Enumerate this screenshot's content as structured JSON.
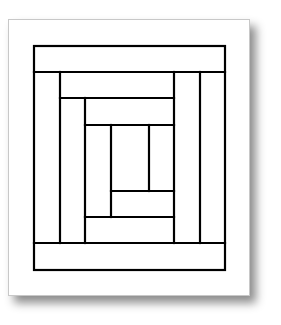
{
  "diagram": {
    "title": "",
    "type": "log-cabin-quilt-block",
    "stroke_color": "#000000",
    "background_color": "#ffffff",
    "page": {
      "left": 8,
      "top": 19,
      "width": 242,
      "height": 277
    },
    "outer_rect": {
      "x1": 34,
      "y1": 46,
      "x2": 225,
      "y2": 270
    },
    "lines": [
      {
        "x1": 34,
        "y1": 72,
        "x2": 225,
        "y2": 72
      },
      {
        "x1": 34,
        "y1": 243,
        "x2": 225,
        "y2": 243
      },
      {
        "x1": 60,
        "y1": 72,
        "x2": 60,
        "y2": 243
      },
      {
        "x1": 200,
        "y1": 72,
        "x2": 200,
        "y2": 243
      },
      {
        "x1": 174,
        "y1": 72,
        "x2": 174,
        "y2": 243
      },
      {
        "x1": 60,
        "y1": 98,
        "x2": 174,
        "y2": 98
      },
      {
        "x1": 85,
        "y1": 98,
        "x2": 85,
        "y2": 243
      },
      {
        "x1": 85,
        "y1": 125,
        "x2": 174,
        "y2": 125
      },
      {
        "x1": 85,
        "y1": 217,
        "x2": 174,
        "y2": 217
      },
      {
        "x1": 111,
        "y1": 125,
        "x2": 111,
        "y2": 217
      },
      {
        "x1": 149,
        "y1": 125,
        "x2": 149,
        "y2": 191
      },
      {
        "x1": 111,
        "y1": 191,
        "x2": 174,
        "y2": 191
      }
    ]
  }
}
